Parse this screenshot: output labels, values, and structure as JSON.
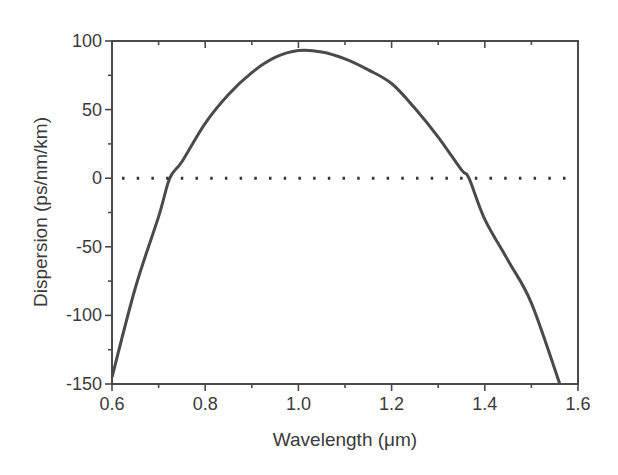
{
  "chart_data": {
    "type": "line",
    "title": "",
    "xlabel": "Wavelength (μm)",
    "ylabel": "Dispersion (ps/nm/km)",
    "xlim": [
      0.6,
      1.6
    ],
    "ylim": [
      -150,
      100
    ],
    "xticks": [
      0.6,
      0.8,
      1.0,
      1.2,
      1.4,
      1.6
    ],
    "xtick_labels": [
      "0.6",
      "0.8",
      "1.0",
      "1.2",
      "1.4",
      "1.6"
    ],
    "yticks": [
      -150,
      -100,
      -50,
      0,
      50,
      100
    ],
    "ytick_labels": [
      "-150",
      "-100",
      "-50",
      "0",
      "50",
      "100"
    ],
    "grid": false,
    "legend": null,
    "series": [
      {
        "name": "Dispersion",
        "style": "solid",
        "color": "#4a4a4a",
        "x": [
          0.6,
          0.65,
          0.7,
          0.724,
          0.75,
          0.8,
          0.85,
          0.9,
          0.95,
          1.0,
          1.05,
          1.1,
          1.15,
          1.2,
          1.25,
          1.3,
          1.35,
          1.366,
          1.4,
          1.45,
          1.5,
          1.561
        ],
        "y": [
          -145,
          -80,
          -28,
          0,
          12,
          40,
          61,
          77,
          88,
          93,
          92,
          87,
          79,
          69,
          51,
          30,
          6,
          0,
          -30,
          -60,
          -91,
          -150
        ]
      },
      {
        "name": "Zero reference",
        "style": "dotted",
        "color": "#333333",
        "x": [
          0.6,
          1.6
        ],
        "y": [
          0,
          0
        ]
      }
    ],
    "annotations": []
  }
}
